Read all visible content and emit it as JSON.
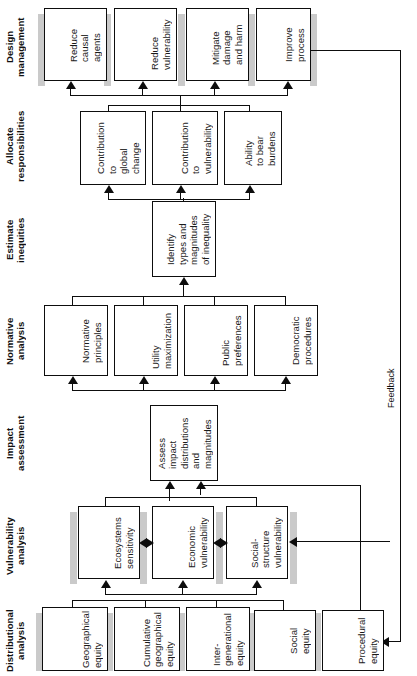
{
  "diagram": {
    "orientation": "rotated-90-ccw",
    "feedback_label": "Feedback",
    "rows": [
      {
        "id": "design-management",
        "label": "Design\nmanagement",
        "boxes": [
          {
            "id": "reduce-causal-agents",
            "text": "Reduce\ncausal\nagents"
          },
          {
            "id": "reduce-vulnerability",
            "text": "Reduce\nvulnerability"
          },
          {
            "id": "mitigate-damage-harm",
            "text": "Mitigate\ndamage\nand harm"
          },
          {
            "id": "improve-process",
            "text": "Improve\nprocess"
          }
        ]
      },
      {
        "id": "allocate-responsibilities",
        "label": "Allocate\nresponsibilities",
        "boxes": [
          {
            "id": "contribution-global-change",
            "text": "Contribution\nto\nglobal\nchange"
          },
          {
            "id": "contribution-vulnerability",
            "text": "Contribution\nto\nvulnerability"
          },
          {
            "id": "ability-bear-burdens",
            "text": "Ability\nto bear\nburdens"
          }
        ]
      },
      {
        "id": "estimate-inequities",
        "label": "Estimate\ninequities",
        "boxes": [
          {
            "id": "identify-types-magnitudes",
            "text": "Identify\ntypes and\nmagnitudes\nof inequality"
          }
        ]
      },
      {
        "id": "normative-analysis",
        "label": "Normative\nanalysis",
        "boxes": [
          {
            "id": "normative-principles",
            "text": "Normative\nprinciples"
          },
          {
            "id": "utility-maximization",
            "text": "Utility\nmaximization"
          },
          {
            "id": "public-preferences",
            "text": "Public\npreferences"
          },
          {
            "id": "democratic-procedures",
            "text": "Democratic\nprocedures"
          }
        ]
      },
      {
        "id": "impact-assessment",
        "label": "Impact\nassessment",
        "boxes": [
          {
            "id": "assess-impact-distributions",
            "text": "Assess\nimpact\ndistributions\nand\nmagnitudes"
          }
        ]
      },
      {
        "id": "vulnerability-analysis",
        "label": "Vulnerability\nanalysis",
        "boxes": [
          {
            "id": "ecosystems-sensitivity",
            "text": "Ecosystems\nsensitivity"
          },
          {
            "id": "economic-vulnerability",
            "text": "Economic\nvulnerability"
          },
          {
            "id": "social-structure-vulnerability",
            "text": "Social-\nstructure\nvulnerability"
          }
        ]
      },
      {
        "id": "distributional-analysis",
        "label": "Distributional\nanalysis",
        "boxes": [
          {
            "id": "geographical-equity",
            "text": "Geographical\nequity"
          },
          {
            "id": "cumulative-geographical-equity",
            "text": "Cumulative\ngeographical\nequity"
          },
          {
            "id": "inter-generational-equity",
            "text": "Inter-\ngenerational\nequity"
          },
          {
            "id": "social-equity",
            "text": "Social\nequity"
          },
          {
            "id": "procedural-equity",
            "text": "Procedural\nequity"
          }
        ]
      }
    ],
    "colors": {
      "line": "#0d0d0d",
      "box_fill": "#ffffff",
      "shadow": "#a9a9a9",
      "text": "#111111"
    }
  }
}
